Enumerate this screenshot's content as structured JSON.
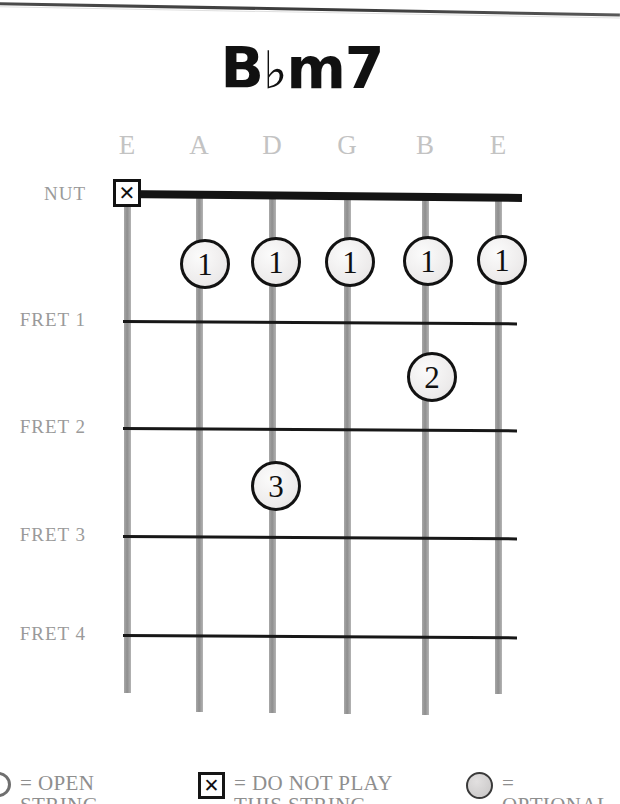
{
  "chord": {
    "title_root": "B",
    "title_accidental": "♭",
    "title_quality": "m7",
    "title_full": "B♭m7"
  },
  "fretboard": {
    "nut_label": "NUT",
    "fret_labels": [
      "FRET 1",
      "FRET 2",
      "FRET 3",
      "FRET 4"
    ],
    "string_labels": [
      "E",
      "A",
      "D",
      "G",
      "B",
      "E"
    ],
    "string_x": [
      127,
      199,
      272,
      347,
      425,
      498
    ],
    "fret_y": [
      320,
      427,
      535,
      634
    ],
    "nut_y": 193,
    "markers": [
      {
        "name": "mute-low-e",
        "type": "mute",
        "string_index": 0,
        "x": 127,
        "y": 193,
        "glyph": "✕"
      },
      {
        "name": "finger-a-fret1",
        "type": "finger",
        "finger": "1",
        "string_index": 1,
        "x": 205,
        "y": 264
      },
      {
        "name": "finger-d-fret1",
        "type": "finger",
        "finger": "1",
        "string_index": 2,
        "x": 276,
        "y": 262
      },
      {
        "name": "finger-g-fret1",
        "type": "finger",
        "finger": "1",
        "string_index": 3,
        "x": 350,
        "y": 262
      },
      {
        "name": "finger-b-fret1",
        "type": "finger",
        "finger": "1",
        "string_index": 4,
        "x": 428,
        "y": 261
      },
      {
        "name": "finger-high-e-fret1",
        "type": "finger",
        "finger": "1",
        "string_index": 5,
        "x": 502,
        "y": 260
      },
      {
        "name": "finger-b-fret2",
        "type": "finger",
        "finger": "2",
        "string_index": 4,
        "x": 432,
        "y": 377
      },
      {
        "name": "finger-d-fret3",
        "type": "finger",
        "finger": "3",
        "string_index": 2,
        "x": 276,
        "y": 486
      }
    ]
  },
  "legend": {
    "items": [
      {
        "name": "legend-open-string",
        "symbol": "open-circle",
        "text": "= OPEN\nSTRING"
      },
      {
        "name": "legend-do-not-play",
        "symbol": "boxed-x",
        "glyph": "✕",
        "text": "= DO NOT PLAY\nTHIS STRING"
      },
      {
        "name": "legend-optional",
        "symbol": "filled-circle",
        "text": "= OPTIONAL"
      }
    ]
  },
  "colors": {
    "ink": "#141414",
    "string_gray": "#9a9a9a",
    "label_gray": "#9a9a9a",
    "string_name_gray": "#c3c3c3",
    "dot_fill": "#efeded",
    "page": "#ffffff"
  }
}
